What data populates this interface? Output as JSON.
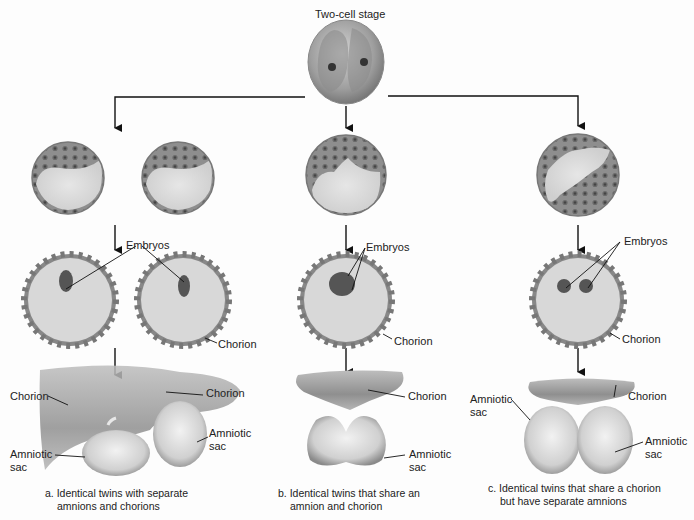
{
  "diagram": {
    "title": "Two-cell stage",
    "labels": {
      "embryos": "Embryos",
      "chorion": "Chorion",
      "amniotic": "Amniotic",
      "sac": "sac"
    },
    "panels": [
      {
        "id": "a",
        "caption_line1": "a. Identical twins with separate",
        "caption_line2": "amnions and chorions",
        "labels": [
          "Embryos",
          "Chorion",
          "Chorion",
          "Chorion",
          "Amniotic sac",
          "Amniotic sac"
        ]
      },
      {
        "id": "b",
        "caption_line1": "b. Identical twins that share an",
        "caption_line2": "amnion and chorion",
        "labels": [
          "Embryos",
          "Chorion",
          "Chorion",
          "Amniotic sac"
        ]
      },
      {
        "id": "c",
        "caption_line1": "c. Identical twins that share a chorion",
        "caption_line2": "but have separate amnions",
        "labels": [
          "Embryos",
          "Chorion",
          "Chorion",
          "Amniotic sac",
          "Amniotic sac"
        ]
      }
    ],
    "colors": {
      "cell_gray": "#9a9a9a",
      "cavity": "#d9d9d9",
      "dark": "#555555",
      "line": "#222222"
    }
  }
}
